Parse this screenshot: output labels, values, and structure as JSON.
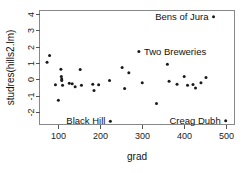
{
  "chart_data": {
    "type": "scatter",
    "title": "",
    "xlabel": "grad",
    "ylabel": "studres(hills2.lm)",
    "xlim": [
      55,
      520
    ],
    "ylim": [
      -2.75,
      4.2
    ],
    "xticks": [
      100,
      200,
      300,
      400,
      500
    ],
    "yticks": [
      -2,
      -1,
      0,
      1,
      2,
      3,
      4
    ],
    "grid": false,
    "legend": null,
    "marker_color": "#1a1a1a",
    "frame_color": "#888888",
    "points": [
      {
        "x": 73,
        "y": 1.05
      },
      {
        "x": 79,
        "y": 1.45
      },
      {
        "x": 93,
        "y": -0.32
      },
      {
        "x": 100,
        "y": -1.27
      },
      {
        "x": 106,
        "y": 0.62
      },
      {
        "x": 107,
        "y": 0.18
      },
      {
        "x": 108,
        "y": 0.02
      },
      {
        "x": 108,
        "y": -0.06
      },
      {
        "x": 110,
        "y": -0.35
      },
      {
        "x": 126,
        "y": -0.23
      },
      {
        "x": 133,
        "y": -0.27
      },
      {
        "x": 140,
        "y": -0.45
      },
      {
        "x": 152,
        "y": 0.6
      },
      {
        "x": 155,
        "y": -0.36
      },
      {
        "x": 182,
        "y": -0.3
      },
      {
        "x": 185,
        "y": -0.67
      },
      {
        "x": 196,
        "y": -0.33
      },
      {
        "x": 222,
        "y": -0.06
      },
      {
        "x": 224,
        "y": -2.55,
        "label": "Black Hill",
        "label_pos": "left"
      },
      {
        "x": 252,
        "y": 0.72
      },
      {
        "x": 258,
        "y": -0.56
      },
      {
        "x": 268,
        "y": 0.4
      },
      {
        "x": 292,
        "y": 1.7,
        "label": "Two Breweries",
        "label_pos": "right"
      },
      {
        "x": 300,
        "y": -0.21
      },
      {
        "x": 334,
        "y": -1.47
      },
      {
        "x": 360,
        "y": 0.92
      },
      {
        "x": 364,
        "y": -0.12
      },
      {
        "x": 383,
        "y": -0.3
      },
      {
        "x": 400,
        "y": 0.17
      },
      {
        "x": 408,
        "y": -0.35
      },
      {
        "x": 421,
        "y": -0.31
      },
      {
        "x": 427,
        "y": -0.52
      },
      {
        "x": 440,
        "y": -0.2
      },
      {
        "x": 452,
        "y": 0.12
      },
      {
        "x": 470,
        "y": 3.82,
        "label": "Bens of Jura",
        "label_pos": "left"
      },
      {
        "x": 499,
        "y": -2.52,
        "label": "Creag Dubh",
        "label_pos": "left"
      }
    ]
  }
}
